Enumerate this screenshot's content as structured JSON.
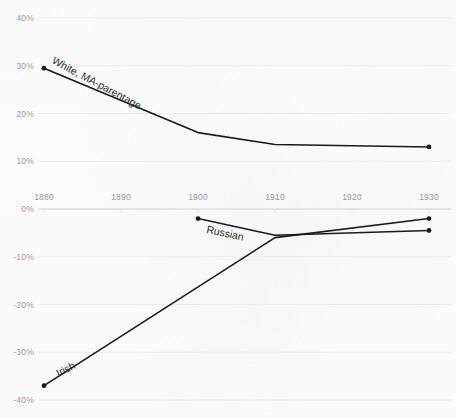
{
  "chart_data": {
    "type": "line",
    "title": "",
    "subtitle": "",
    "xlabel": "",
    "ylabel": "",
    "x": [
      1880,
      1890,
      1900,
      1910,
      1920,
      1930
    ],
    "xtick_labels": [
      "1880",
      "1890",
      "1900",
      "1910",
      "1920",
      "1930"
    ],
    "ytick_labels": [
      "40%",
      "30%",
      "20%",
      "10%",
      "0%",
      "-10%",
      "-20%",
      "-30%",
      "-40%"
    ],
    "ytick_values": [
      40,
      30,
      20,
      10,
      0,
      -10,
      -20,
      -30,
      -40
    ],
    "xlim": [
      1880,
      1930
    ],
    "ylim": [
      -40,
      40
    ],
    "grid": true,
    "grid_axis": "y",
    "legend": "inline-labels",
    "legend_position": "along-series",
    "marker": "circle",
    "line_color": "#1a1a1a",
    "grid_color": "#ebebeb",
    "tick_color": "#9b9b9b",
    "background_color": "#fdfdfd",
    "series": [
      {
        "name": "White, MA-parentage",
        "label": "White, MA-parentage",
        "label_rotation_deg": 28,
        "x": [
          1880,
          1900,
          1910,
          1930
        ],
        "values": [
          29.5,
          16.0,
          13.5,
          13.0
        ],
        "markers_at": [
          1880,
          1930
        ]
      },
      {
        "name": "Russian",
        "label": "Russian",
        "label_rotation_deg": 12,
        "x": [
          1900,
          1910,
          1930
        ],
        "values": [
          -2.0,
          -5.5,
          -4.5
        ],
        "markers_at": [
          1900,
          1930
        ]
      },
      {
        "name": "Irish",
        "label": "Irish",
        "label_rotation_deg": -27,
        "x": [
          1880,
          1910,
          1930
        ],
        "values": [
          -37.0,
          -6.0,
          -2.0
        ],
        "markers_at": [
          1880,
          1930
        ]
      }
    ]
  },
  "overflow": {
    "top_right_text": ""
  }
}
